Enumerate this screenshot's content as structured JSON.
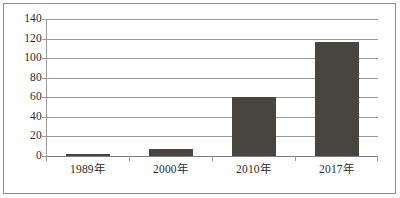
{
  "chart_data": {
    "type": "bar",
    "title": "",
    "subtitle": "",
    "xlabel": "",
    "ylabel": "",
    "categories": [
      "1989年",
      "2000年",
      "2010年",
      "2017年"
    ],
    "values": [
      2,
      7,
      60,
      117
    ],
    "ylim": [
      0,
      140
    ],
    "ytick_step": 20,
    "yticks": [
      0,
      20,
      40,
      60,
      80,
      100,
      120,
      140
    ],
    "ytick_labels": [
      "0",
      "20",
      "40",
      "60",
      "80",
      "100",
      "120",
      "140"
    ],
    "grid": true,
    "grid_axis": "y",
    "legend": false,
    "legend_position": "none",
    "series": [
      {
        "name": "",
        "values": [
          2,
          7,
          60,
          117
        ]
      }
    ],
    "colors": {
      "bar_fill": "#484440",
      "gridline": "#9a9a9a",
      "axis": "#9a9a9a",
      "frame": "#8e8e8e",
      "text": "#2b2b2b",
      "background": "#ffffff"
    }
  },
  "figure": {
    "frame_visible": true,
    "background": "#ffffff"
  }
}
